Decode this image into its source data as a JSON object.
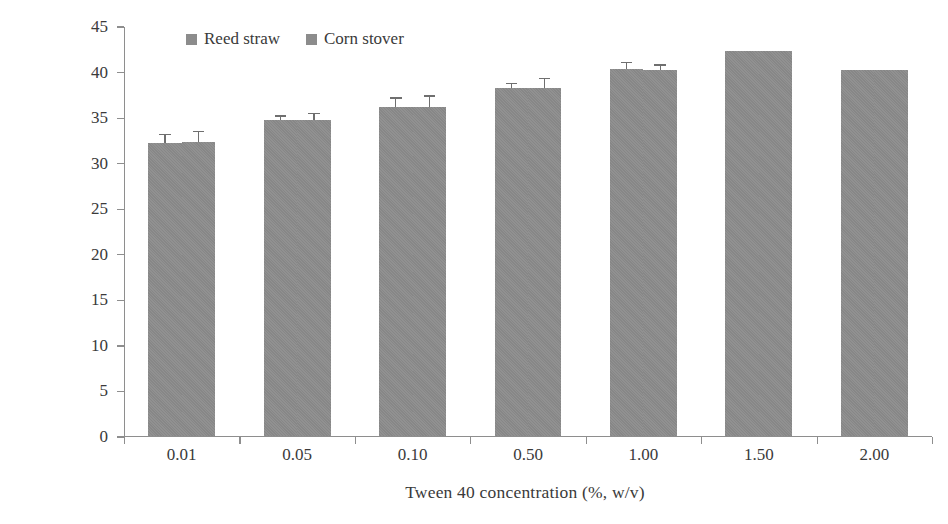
{
  "chart_data": {
    "type": "bar",
    "title": "",
    "subtitle": "",
    "xlabel": "Tween 40 concentration (%, w/v)",
    "ylabel": "Ethanol concentration (g/L)",
    "categories": [
      "0.01",
      "0.05",
      "0.10",
      "0.50",
      "1.00",
      "1.50",
      "2.00"
    ],
    "series": [
      {
        "name": "Reed straw",
        "color": "#8c8c8c",
        "values": [
          32.1,
          34.6,
          36.1,
          38.1,
          40.2,
          42.2,
          40.1
        ],
        "errors": [
          0.9,
          0.4,
          0.9,
          0.5,
          0.7,
          0,
          0
        ]
      },
      {
        "name": "Corn stover",
        "color": "#8c8c8c",
        "values": [
          32.2,
          34.6,
          36.1,
          38.2,
          40.1,
          42.2,
          40.1
        ],
        "errors": [
          1.1,
          0.7,
          1.1,
          0.9,
          0.5,
          0,
          0
        ]
      }
    ],
    "ylim": [
      0,
      45
    ],
    "ytick_values": [
      0,
      5,
      10,
      15,
      20,
      25,
      30,
      35,
      40,
      45
    ],
    "ytick_labels": [
      "0",
      "5",
      "10",
      "15",
      "20",
      "25",
      "30",
      "35",
      "40",
      "45"
    ],
    "grid": false,
    "legend_position": "top-left",
    "axis_color": "#8e8e8e",
    "text_color": "#3a3a3a"
  },
  "legend": {
    "items": [
      {
        "label": "Reed straw"
      },
      {
        "label": "Corn stover"
      }
    ]
  }
}
